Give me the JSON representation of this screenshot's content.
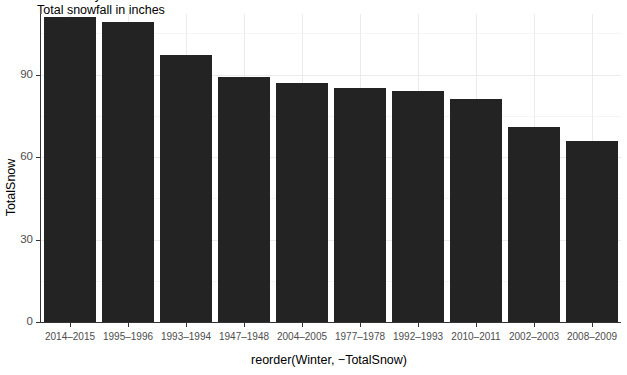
{
  "titles": {
    "clipped_top_line": "Snowfall by winter season",
    "subtitle": "Total snowfall in inches"
  },
  "axes": {
    "y_title": "TotalSnow",
    "x_title": "reorder(Winter, −TotalSnow)",
    "y_ticks": [
      "0",
      "30",
      "60",
      "90"
    ],
    "y_tick_values": [
      0,
      30,
      60,
      90
    ]
  },
  "chart_data": {
    "type": "bar",
    "title": "Total snowfall in inches",
    "xlabel": "reorder(Winter, −TotalSnow)",
    "ylabel": "TotalSnow",
    "ylim": [
      0,
      112
    ],
    "grid": true,
    "legend": "none",
    "bar_color": "#232323",
    "categories": [
      "2014–2015",
      "1995–1996",
      "1993–1994",
      "1947–1948",
      "2004–2005",
      "1977–1978",
      "1992–1993",
      "2010–2011",
      "2002–2003",
      "2008–2009"
    ],
    "values": [
      111,
      109,
      97,
      89,
      87,
      85,
      84,
      81,
      71,
      66
    ]
  }
}
